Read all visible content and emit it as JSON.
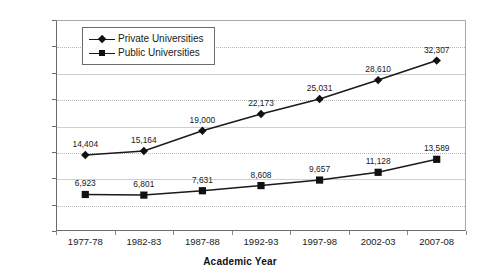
{
  "chart_data": {
    "type": "line",
    "title": "",
    "xlabel": "Academic Year",
    "ylabel": "",
    "categories": [
      "1977-78",
      "1982-83",
      "1987-88",
      "1992-93",
      "1997-98",
      "2002-03",
      "2007-08"
    ],
    "series": [
      {
        "name": "Private Universities",
        "marker": "diamond",
        "values": [
          14404,
          15164,
          19000,
          22173,
          25031,
          28610,
          32307
        ],
        "labels": [
          "14,404",
          "15,164",
          "19,000",
          "22,173",
          "25,031",
          "28,610",
          "32,307"
        ]
      },
      {
        "name": "Public Universities",
        "marker": "square",
        "values": [
          6923,
          6801,
          7631,
          8608,
          9657,
          11128,
          13589
        ],
        "labels": [
          "6,923",
          "6,801",
          "7,631",
          "8,608",
          "9,657",
          "11,128",
          "13,589"
        ]
      }
    ],
    "ylim": [
      0,
      40000
    ],
    "ytick_values": [
      0,
      5000,
      10000,
      15000,
      20000,
      25000,
      30000,
      35000,
      40000
    ],
    "ytick_labels": [
      "$0",
      "$5,000",
      "$10,000",
      "$15,000",
      "$20,000",
      "$25,000",
      "$30,000",
      "$35,000",
      "$40,000"
    ],
    "grid": true,
    "legend_position": "top-left",
    "line_color": "#1a1a1a",
    "grid_color": "#b9b9b9",
    "axis_color": "#6b6b6b"
  }
}
